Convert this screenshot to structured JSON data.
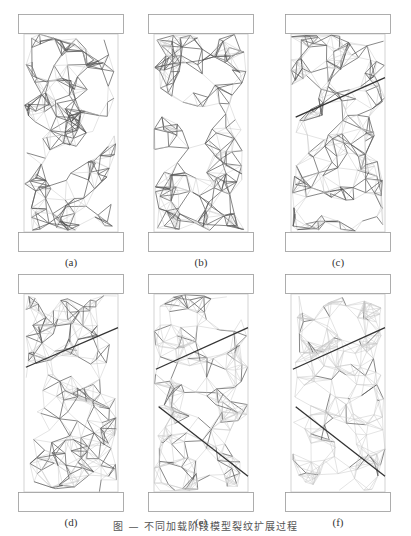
{
  "figure": {
    "caption": "图 — 不同加载阶段模型裂纹扩展过程",
    "panels": [
      {
        "id": "a",
        "label": "(a)",
        "row": 0,
        "col": 0,
        "cracks": []
      },
      {
        "id": "b",
        "label": "(b)",
        "row": 0,
        "col": 1,
        "cracks": []
      },
      {
        "id": "c",
        "label": "(c)",
        "row": 0,
        "col": 2,
        "cracks": [
          [
            0.05,
            0.42,
            1.0,
            0.22
          ]
        ]
      },
      {
        "id": "d",
        "label": "(d)",
        "row": 1,
        "col": 0,
        "cracks": [
          [
            0.02,
            0.37,
            1.0,
            0.17
          ]
        ]
      },
      {
        "id": "e",
        "label": "(e)",
        "row": 1,
        "col": 1,
        "cracks": [
          [
            0.02,
            0.38,
            1.0,
            0.17
          ],
          [
            0.05,
            0.57,
            1.0,
            0.92
          ]
        ]
      },
      {
        "id": "f",
        "label": "(f)",
        "row": 1,
        "col": 2,
        "cracks": [
          [
            0.02,
            0.38,
            1.0,
            0.17
          ],
          [
            0.05,
            0.57,
            1.0,
            0.92
          ]
        ]
      }
    ],
    "colors": {
      "mesh_light": "#c8c8c8",
      "mesh_dark": "#555555",
      "platen_border": "#999999",
      "crack": "#333333"
    },
    "mesh_density": {
      "a": 0.55,
      "b": 0.5,
      "c": 0.45,
      "d": 0.35,
      "e": 0.2,
      "f": 0.08
    }
  }
}
